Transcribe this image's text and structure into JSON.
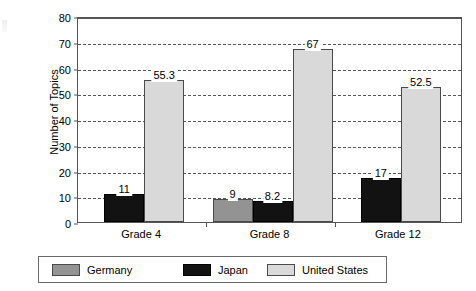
{
  "chart_data": {
    "type": "bar",
    "title": "",
    "xlabel": "",
    "ylabel": "Number of Topics",
    "categories": [
      "Grade 4",
      "Grade 8",
      "Grade 12"
    ],
    "ylim": [
      0,
      80
    ],
    "ytick_step": 10,
    "yticks": [
      "80",
      "70",
      "60",
      "50",
      "40",
      "30",
      "20",
      "10",
      "0"
    ],
    "grid": true,
    "legend_position": "bottom",
    "series": [
      {
        "name": "Germany",
        "color": "#939393",
        "values": [
          null,
          9,
          null
        ],
        "labels": [
          "",
          "9",
          ""
        ]
      },
      {
        "name": "Japan",
        "color": "#121212",
        "values": [
          11,
          8.2,
          17
        ],
        "labels": [
          "11",
          "8.2",
          "17"
        ]
      },
      {
        "name": "United States",
        "color": "#d9d9d9",
        "values": [
          55.3,
          67,
          52.5
        ],
        "labels": [
          "55.3",
          "67",
          "52.5"
        ]
      }
    ]
  },
  "legend": {
    "items": [
      {
        "label": "Germany",
        "swatch": "germany"
      },
      {
        "label": "Japan",
        "swatch": "japan"
      },
      {
        "label": "United States",
        "swatch": "us"
      }
    ]
  }
}
